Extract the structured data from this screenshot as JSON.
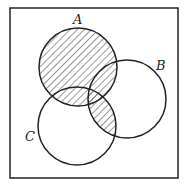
{
  "diagram": {
    "type": "venn",
    "universe_frame": {
      "x": 10,
      "y": 8,
      "width": 168,
      "height": 170
    },
    "sets": [
      {
        "id": "A",
        "label": "A",
        "cx": 78,
        "cy": 67,
        "r": 39,
        "label_x": 73,
        "label_y": 24
      },
      {
        "id": "B",
        "label": "B",
        "cx": 127,
        "cy": 99,
        "r": 39,
        "label_x": 156,
        "label_y": 70
      },
      {
        "id": "C",
        "label": "C",
        "cx": 77,
        "cy": 126,
        "r": 39,
        "label_x": 25,
        "label_y": 141
      }
    ],
    "shaded_region": "A ∪ (B ∩ C)",
    "colors": {
      "stroke": "#222222",
      "hatch": "#333333",
      "background": "#ffffff"
    }
  }
}
